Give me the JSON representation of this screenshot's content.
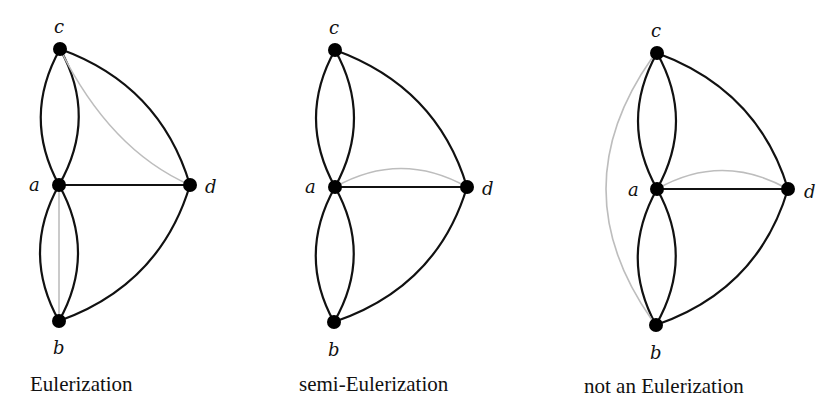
{
  "figure": {
    "panels": [
      {
        "caption": "Eulerization",
        "vertices": {
          "a": "a",
          "b": "b",
          "c": "c",
          "d": "d"
        },
        "added_edges": [
          "c-d",
          "a-b"
        ]
      },
      {
        "caption": "semi-Eulerization",
        "vertices": {
          "a": "a",
          "b": "b",
          "c": "c",
          "d": "d"
        },
        "added_edges": [
          "a-d"
        ]
      },
      {
        "caption": "not an Eulerization",
        "vertices": {
          "a": "a",
          "b": "b",
          "c": "c",
          "d": "d"
        },
        "added_edges": [
          "a-d",
          "c-b"
        ]
      }
    ],
    "base_edges": [
      "c-a (x2)",
      "a-b (x2)",
      "c-d",
      "a-d",
      "b-d"
    ],
    "colors": {
      "edge": "#111111",
      "added_edge": "#bdbdbd",
      "node": "#000000"
    }
  }
}
